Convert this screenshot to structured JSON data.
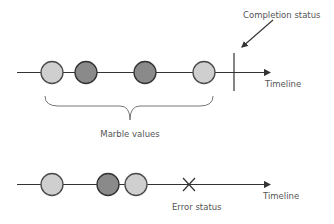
{
  "diagram": {
    "top_timeline": {
      "label": "Timeline",
      "marbles": [
        {
          "x": 52,
          "shade": "light"
        },
        {
          "x": 86,
          "shade": "dark"
        },
        {
          "x": 145,
          "shade": "dark"
        },
        {
          "x": 204,
          "shade": "light"
        }
      ],
      "completion_label": "Completion status",
      "brace_label": "Marble values"
    },
    "bottom_timeline": {
      "label": "Timeline",
      "marbles": [
        {
          "x": 52,
          "shade": "light"
        },
        {
          "x": 108,
          "shade": "dark"
        },
        {
          "x": 136,
          "shade": "light"
        }
      ],
      "error_label": "Error status"
    },
    "colors": {
      "line": "#333333",
      "light_fill": "#cfcfcf",
      "dark_fill": "#8a8a8a",
      "stroke": "#3a3a3a",
      "text": "#555555"
    }
  }
}
